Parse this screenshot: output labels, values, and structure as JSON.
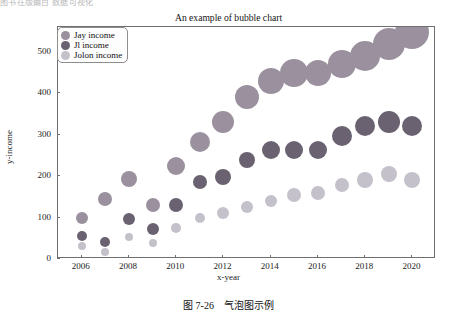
{
  "page": {
    "top_fragment": "图书在版编目  数据可视化",
    "caption_number": "图 7-26",
    "caption_text": "气泡图示例"
  },
  "chart_data": {
    "type": "scatter",
    "title": "An example of bubble chart",
    "xlabel": "x-year",
    "ylabel": "y-income",
    "xlim": [
      2005,
      2021
    ],
    "ylim": [
      0,
      560
    ],
    "xticks": [
      2006,
      2008,
      2010,
      2012,
      2014,
      2016,
      2018,
      2020
    ],
    "yticks": [
      0,
      100,
      200,
      300,
      400,
      500
    ],
    "grid": false,
    "legend_position": "upper left",
    "x": [
      2006,
      2007,
      2008,
      2009,
      2010,
      2011,
      2012,
      2013,
      2014,
      2015,
      2016,
      2017,
      2018,
      2019,
      2020
    ],
    "series": [
      {
        "name": "Jay income",
        "color": "#9a909e",
        "values": [
          98,
          145,
          192,
          130,
          225,
          283,
          330,
          390,
          430,
          450,
          448,
          470,
          490,
          520,
          548
        ],
        "sizes": [
          6,
          7,
          8,
          7,
          9,
          10,
          11,
          12,
          13,
          14,
          13,
          14,
          15,
          16,
          17
        ]
      },
      {
        "name": "Jl income",
        "color": "#6a6270",
        "values": [
          55,
          40,
          97,
          73,
          130,
          186,
          198,
          240,
          263,
          263,
          262,
          298,
          320,
          330,
          322
        ],
        "sizes": [
          5,
          5,
          6,
          6,
          7,
          7,
          8,
          8,
          9,
          9,
          9,
          10,
          10,
          11,
          10
        ]
      },
      {
        "name": "Jolon income",
        "color": "#c5c1cb",
        "values": [
          32,
          18,
          52,
          38,
          75,
          100,
          112,
          125,
          140,
          155,
          160,
          178,
          190,
          205,
          190
        ],
        "sizes": [
          4,
          4,
          4,
          4,
          5,
          5,
          6,
          6,
          6,
          7,
          7,
          7,
          8,
          8,
          8
        ]
      }
    ]
  }
}
